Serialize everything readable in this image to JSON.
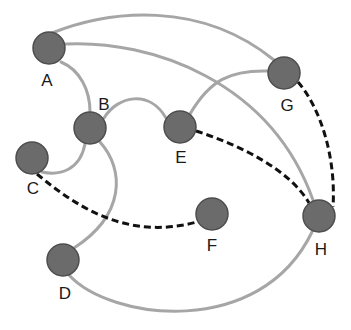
{
  "diagram": {
    "type": "graph",
    "colors": {
      "node_fill": "#6b6b6b",
      "node_stroke": "#4d4d4d",
      "solid_edge": "#a6a6a6",
      "dashed_edge": "#111111",
      "label": "#1a1a1a",
      "background": "#ffffff"
    },
    "nodes": [
      {
        "id": "A",
        "label": "A",
        "x": 49,
        "y": 48,
        "label_x": 47,
        "label_y": 86
      },
      {
        "id": "B",
        "label": "B",
        "x": 90,
        "y": 128,
        "label_x": 104,
        "label_y": 110
      },
      {
        "id": "C",
        "label": "C",
        "x": 32,
        "y": 158,
        "label_x": 33,
        "label_y": 194
      },
      {
        "id": "D",
        "label": "D",
        "x": 63,
        "y": 260,
        "label_x": 65,
        "label_y": 299
      },
      {
        "id": "E",
        "label": "E",
        "x": 180,
        "y": 127,
        "label_x": 181,
        "label_y": 163
      },
      {
        "id": "F",
        "label": "F",
        "x": 212,
        "y": 214,
        "label_x": 212,
        "label_y": 251
      },
      {
        "id": "G",
        "label": "G",
        "x": 284,
        "y": 73,
        "label_x": 287,
        "label_y": 111
      },
      {
        "id": "H",
        "label": "H",
        "x": 319,
        "y": 216,
        "label_x": 321,
        "label_y": 255
      }
    ],
    "edges": [
      {
        "from": "A",
        "to": "G",
        "style": "solid"
      },
      {
        "from": "A",
        "to": "H",
        "style": "solid"
      },
      {
        "from": "A",
        "to": "B",
        "style": "solid"
      },
      {
        "from": "B",
        "to": "E",
        "style": "solid"
      },
      {
        "from": "B",
        "to": "C",
        "style": "solid"
      },
      {
        "from": "B",
        "to": "D",
        "style": "solid"
      },
      {
        "from": "E",
        "to": "G",
        "style": "solid"
      },
      {
        "from": "D",
        "to": "H",
        "style": "solid"
      },
      {
        "from": "G",
        "to": "H",
        "style": "dashed"
      },
      {
        "from": "E",
        "to": "H",
        "style": "dashed"
      },
      {
        "from": "C",
        "to": "F",
        "style": "dashed"
      }
    ]
  }
}
